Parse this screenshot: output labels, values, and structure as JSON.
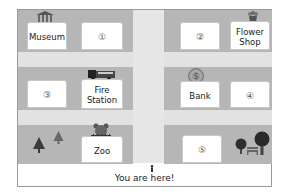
{
  "map": {
    "locations": [
      {
        "id": "museum",
        "label": "Museum"
      },
      {
        "id": "lot1",
        "label": "①"
      },
      {
        "id": "lot2",
        "label": "②"
      },
      {
        "id": "flower",
        "label": "Flower Shop",
        "line1": "Flower",
        "line2": "Shop"
      },
      {
        "id": "lot3",
        "label": "③"
      },
      {
        "id": "fire",
        "label": "Fire Station",
        "line1": "Fire",
        "line2": "Station"
      },
      {
        "id": "bank",
        "label": "Bank"
      },
      {
        "id": "lot4",
        "label": "④"
      },
      {
        "id": "zoo",
        "label": "Zoo"
      },
      {
        "id": "lot5",
        "label": "⑤"
      }
    ],
    "you_are_here": "You are here!",
    "colors": {
      "block": "#b6b6b6",
      "road": "#e4e4e4",
      "building": "#ffffff",
      "tree": "#3a3a3a"
    }
  }
}
